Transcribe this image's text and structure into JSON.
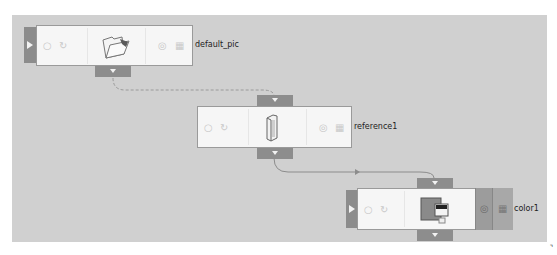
{
  "canvas": {
    "background": "#d0d0d0"
  },
  "nodes": [
    {
      "id": "default_pic",
      "label": "default_pic",
      "thumbnail": "folder-icon",
      "state": "normal"
    },
    {
      "id": "reference1",
      "label": "reference1",
      "thumbnail": "book-icon",
      "state": "normal"
    },
    {
      "id": "color1",
      "label": "color1",
      "thumbnail": "color-swatch-icon",
      "state": "selected"
    }
  ],
  "connections": [
    {
      "from": "default_pic",
      "to": "reference1",
      "style": "dashed"
    },
    {
      "from": "reference1",
      "to": "color1",
      "style": "solid"
    }
  ],
  "node_icons": {
    "enable": "○",
    "cycle": "↻",
    "render": "◎",
    "film": "▦"
  },
  "corner_mark": "⌝"
}
